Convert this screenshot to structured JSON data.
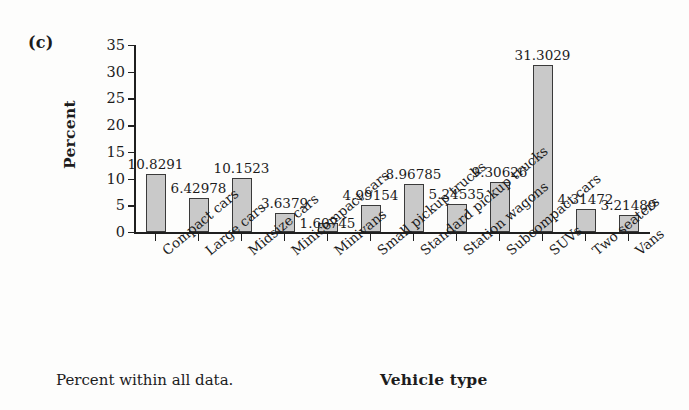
{
  "panel": {
    "label": "(c)"
  },
  "footer": {
    "note": "Percent within all data.",
    "x_axis_title": "Vehicle type"
  },
  "axes": {
    "y_title": "Percent",
    "y_ticks": [
      "0",
      "5",
      "10",
      "15",
      "20",
      "25",
      "30",
      "35"
    ]
  },
  "colors": {
    "bar_fill": "#c9c9c9",
    "bar_border": "#3a3a3a",
    "axis": "#1f1f1f",
    "text": "#1c1c1c",
    "background": "#fdfdfc"
  },
  "chart_data": {
    "type": "bar",
    "title": "",
    "subtitle": "",
    "xlabel": "Vehicle type",
    "ylabel": "Percent",
    "ylim": [
      0,
      35
    ],
    "yticks": [
      0,
      5,
      10,
      15,
      20,
      25,
      30,
      35
    ],
    "grid": false,
    "legend": null,
    "annotation": "Percent within all data.",
    "panel_label": "(c)",
    "categories": [
      "Compact cars",
      "Large cars",
      "Midsize cars",
      "Minicompact cars",
      "Minivans",
      "Small pickup trucks",
      "Standard pickup trucks",
      "Station wagons",
      "Subcompact cars",
      "SUVs",
      "Two seaters",
      "Vans"
    ],
    "values": [
      10.8291,
      6.42978,
      10.1523,
      3.6379,
      1.60745,
      4.99154,
      8.96785,
      5.24535,
      9.30626,
      31.3029,
      4.31472,
      3.21489
    ],
    "value_labels": [
      "10.8291",
      "6.42978",
      "10.1523",
      "3.6379",
      "1.60745",
      "4.99154",
      "8.96785",
      "5.24535",
      "9.30626",
      "31.3029",
      "4.31472",
      "3.21489"
    ]
  }
}
